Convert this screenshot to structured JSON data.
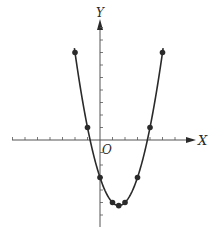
{
  "chart_data": {
    "type": "line",
    "title": "",
    "function": "y = x^2 - 3x - 3",
    "xlabel": "X",
    "ylabel": "Y",
    "origin_label": "O",
    "x": [
      -2,
      -1,
      0,
      1,
      1.5,
      2,
      3,
      4,
      5
    ],
    "series": [
      {
        "name": "parabola",
        "values": [
          7,
          1,
          -3,
          -5,
          -5.25,
          -5,
          -3,
          1,
          7
        ]
      }
    ],
    "xlim": [
      -7,
      7.5
    ],
    "ylim": [
      -7,
      9.5
    ],
    "grid": false,
    "tick_unit": 1,
    "markers": true,
    "legend": null
  },
  "colors": {
    "ink": "#2a2a2a",
    "axis": "#555555",
    "background": "#ffffff"
  }
}
